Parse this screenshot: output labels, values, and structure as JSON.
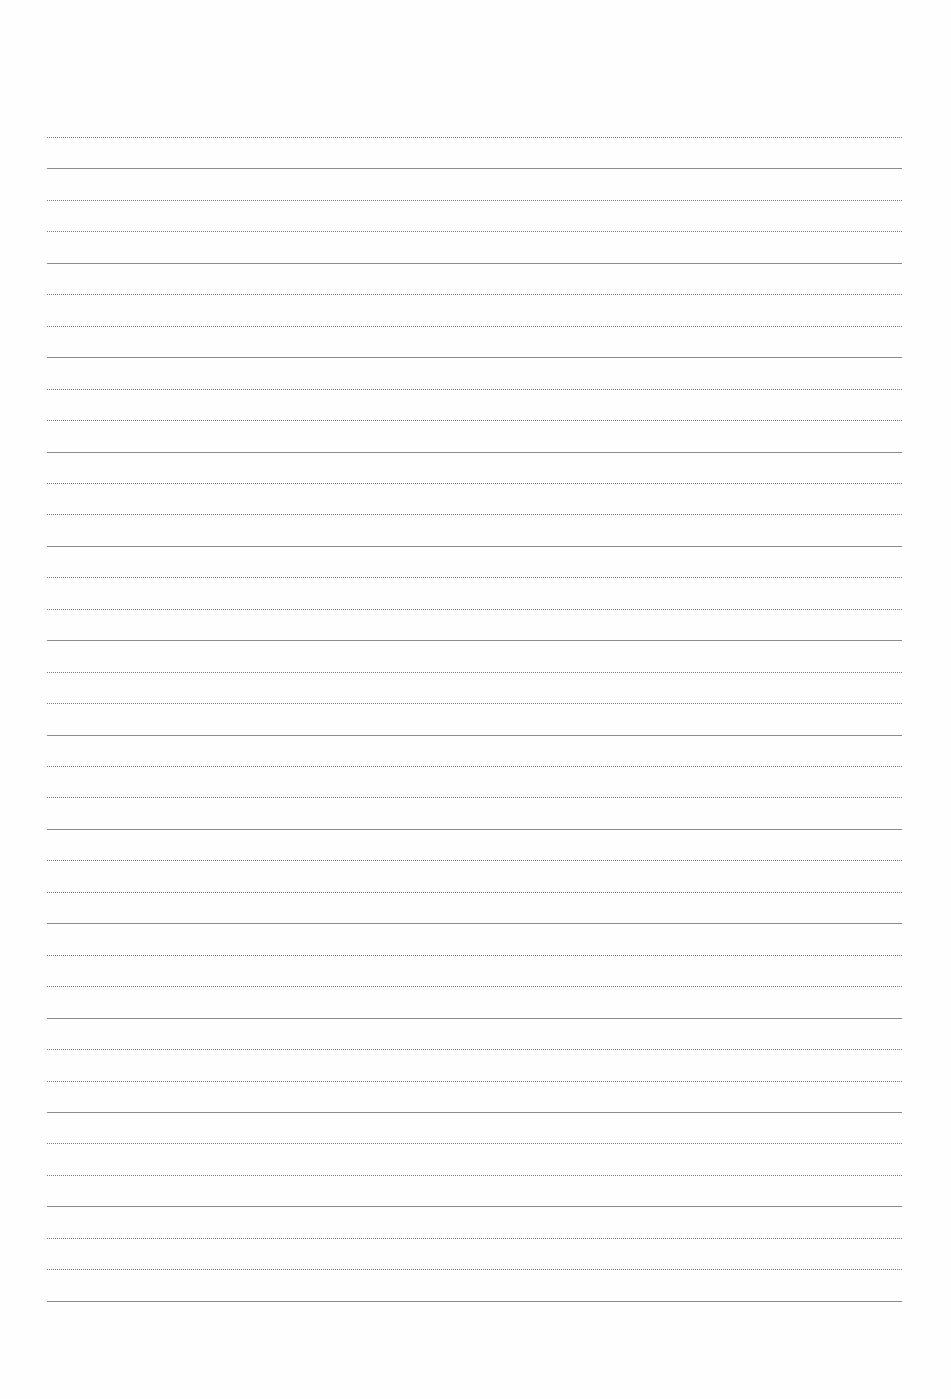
{
  "page": {
    "type": "lined-paper",
    "background": "#fefefe",
    "line_color": "#8a8a8a",
    "line_left": 47,
    "line_right": 902,
    "first_line_y": 137,
    "line_spacing": 31.45,
    "line_count": 38
  }
}
